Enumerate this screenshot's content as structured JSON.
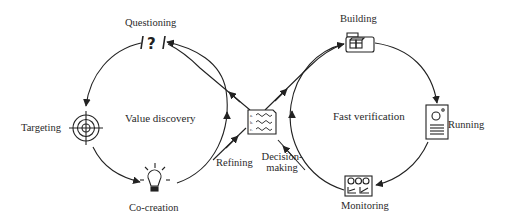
{
  "diagram": {
    "left_loop": {
      "title": "Value discovery",
      "stages": [
        {
          "id": "questioning",
          "label": "Questioning",
          "icon": "question-mark-icon"
        },
        {
          "id": "targeting",
          "label": "Targeting",
          "icon": "target-icon"
        },
        {
          "id": "co-creation",
          "label": "Co-creation",
          "icon": "lightbulb-icon"
        }
      ]
    },
    "right_loop": {
      "title": "Fast verification",
      "stages": [
        {
          "id": "building",
          "label": "Building",
          "icon": "folder-blocks-icon"
        },
        {
          "id": "running",
          "label": "Running",
          "icon": "server-icon"
        },
        {
          "id": "monitoring",
          "label": "Monitoring",
          "icon": "dashboard-icon"
        }
      ]
    },
    "bridge": {
      "icon": "requirements-document-icon",
      "doc_items": [
        "a.",
        "b.",
        "c."
      ],
      "labels": {
        "refining": "Refining",
        "decision_line1": "Decision-",
        "decision_line2": "making"
      }
    },
    "colors": {
      "stroke": "#222222",
      "text": "#2a2a2a",
      "background": "#ffffff"
    }
  }
}
